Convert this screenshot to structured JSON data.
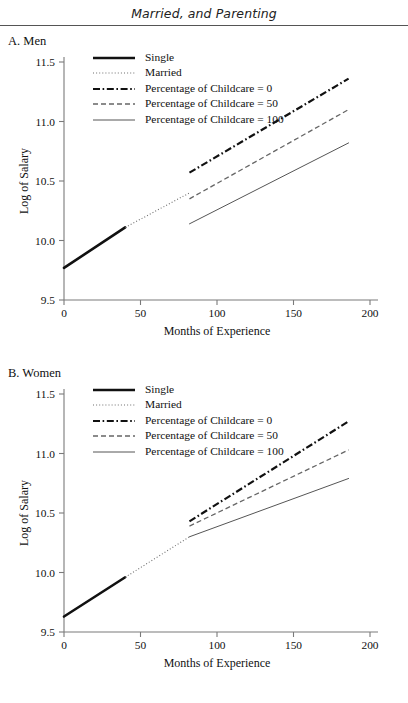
{
  "running_head": "Married, and Parenting",
  "panels": [
    {
      "id": "a",
      "label": "A. Men",
      "legend": [
        {
          "style": "solid-thick",
          "label": "Single"
        },
        {
          "style": "dotted",
          "label": "Married"
        },
        {
          "style": "dash-dot",
          "label": "Percentage of Childcare = 0"
        },
        {
          "style": "dashed",
          "label": "Percentage of Childcare = 50"
        },
        {
          "style": "solid-thin",
          "label": "Percentage of Childcare = 100"
        }
      ]
    },
    {
      "id": "b",
      "label": "B. Women",
      "legend": [
        {
          "style": "solid-thick",
          "label": "Single"
        },
        {
          "style": "dotted",
          "label": "Married"
        },
        {
          "style": "dash-dot",
          "label": "Percentage of Childcare = 0"
        },
        {
          "style": "dashed",
          "label": "Percentage of Childcare = 50"
        },
        {
          "style": "solid-thin",
          "label": "Percentage of Childcare = 100"
        }
      ]
    }
  ],
  "chart_data": [
    {
      "type": "line",
      "panel": "A. Men",
      "title": "A. Men",
      "xlabel": "Months of Experience",
      "ylabel": "Log of Salary",
      "xlim": [
        0,
        200
      ],
      "ylim": [
        9.5,
        11.5
      ],
      "xticks": [
        0,
        50,
        100,
        150,
        200
      ],
      "yticks": [
        9.5,
        10.0,
        10.5,
        11.0,
        11.5
      ],
      "xticklabels": [
        "0",
        "50",
        "100",
        "150",
        "200"
      ],
      "yticklabels": [
        "9.5",
        "10.0",
        "10.5",
        "11.0",
        "11.5"
      ],
      "grid": false,
      "legend_position": "upper-left-inside",
      "series": [
        {
          "name": "Single",
          "style": "solid-thick",
          "x": [
            0,
            40
          ],
          "y": [
            9.77,
            10.11
          ]
        },
        {
          "name": "Married",
          "style": "dotted",
          "x": [
            40,
            82
          ],
          "y": [
            10.11,
            10.4
          ]
        },
        {
          "name": "Percentage of Childcare = 0",
          "style": "dash-dot",
          "x": [
            82,
            186
          ],
          "y": [
            10.57,
            11.36
          ]
        },
        {
          "name": "Percentage of Childcare = 50",
          "style": "dashed",
          "x": [
            82,
            186
          ],
          "y": [
            10.35,
            11.1
          ]
        },
        {
          "name": "Percentage of Childcare = 100",
          "style": "solid-thin",
          "x": [
            82,
            186
          ],
          "y": [
            10.14,
            10.82
          ]
        }
      ]
    },
    {
      "type": "line",
      "panel": "B. Women",
      "title": "B. Women",
      "xlabel": "Months of Experience",
      "ylabel": "Log of Salary",
      "xlim": [
        0,
        200
      ],
      "ylim": [
        9.5,
        11.5
      ],
      "xticks": [
        0,
        50,
        100,
        150,
        200
      ],
      "yticks": [
        9.5,
        10.0,
        10.5,
        11.0,
        11.5
      ],
      "xticklabels": [
        "0",
        "50",
        "100",
        "150",
        "200"
      ],
      "yticklabels": [
        "9.5",
        "10.0",
        "10.5",
        "11.0",
        "11.5"
      ],
      "grid": false,
      "legend_position": "upper-left-inside",
      "series": [
        {
          "name": "Single",
          "style": "solid-thick",
          "x": [
            0,
            40
          ],
          "y": [
            9.63,
            9.96
          ]
        },
        {
          "name": "Married",
          "style": "dotted",
          "x": [
            40,
            82
          ],
          "y": [
            9.96,
            10.3
          ]
        },
        {
          "name": "Percentage of Childcare = 0",
          "style": "dash-dot",
          "x": [
            82,
            186
          ],
          "y": [
            10.43,
            11.27
          ]
        },
        {
          "name": "Percentage of Childcare = 50",
          "style": "dashed",
          "x": [
            82,
            186
          ],
          "y": [
            10.39,
            11.03
          ]
        },
        {
          "name": "Percentage of Childcare = 100",
          "style": "solid-thin",
          "x": [
            82,
            186
          ],
          "y": [
            10.3,
            10.79
          ]
        }
      ]
    }
  ],
  "colors": {
    "ink": "#111111",
    "axis": "#7a7a7a",
    "thin_line": "#555555",
    "rule": "#555555",
    "background": "#ffffff"
  }
}
